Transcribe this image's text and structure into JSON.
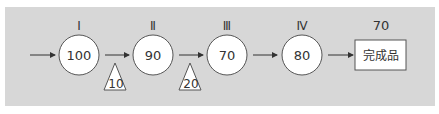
{
  "diagram": {
    "stages": [
      {
        "label": "Ⅰ",
        "value": "100"
      },
      {
        "label": "Ⅱ",
        "value": "90"
      },
      {
        "label": "Ⅲ",
        "value": "70"
      },
      {
        "label": "Ⅳ",
        "value": "80"
      }
    ],
    "losses": [
      {
        "value": "10"
      },
      {
        "value": "20"
      }
    ],
    "output": {
      "label": "70",
      "text": "完成品"
    }
  },
  "colors": {
    "panel": "#d7d7d7",
    "node_fill": "#ffffff",
    "stroke": "#555555",
    "text": "#333333"
  }
}
